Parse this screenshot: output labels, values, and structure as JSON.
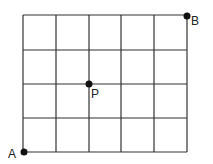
{
  "diagram": {
    "type": "grid-path",
    "columns": 5,
    "rows": 4,
    "points": [
      {
        "label": "A",
        "col": 0,
        "row": 4,
        "position": "bottom-left"
      },
      {
        "label": "P",
        "col": 2,
        "row": 2,
        "position": "interior"
      },
      {
        "label": "B",
        "col": 5,
        "row": 0,
        "position": "top-right"
      }
    ]
  },
  "labels": {
    "a": "A",
    "p": "P",
    "b": "B"
  }
}
